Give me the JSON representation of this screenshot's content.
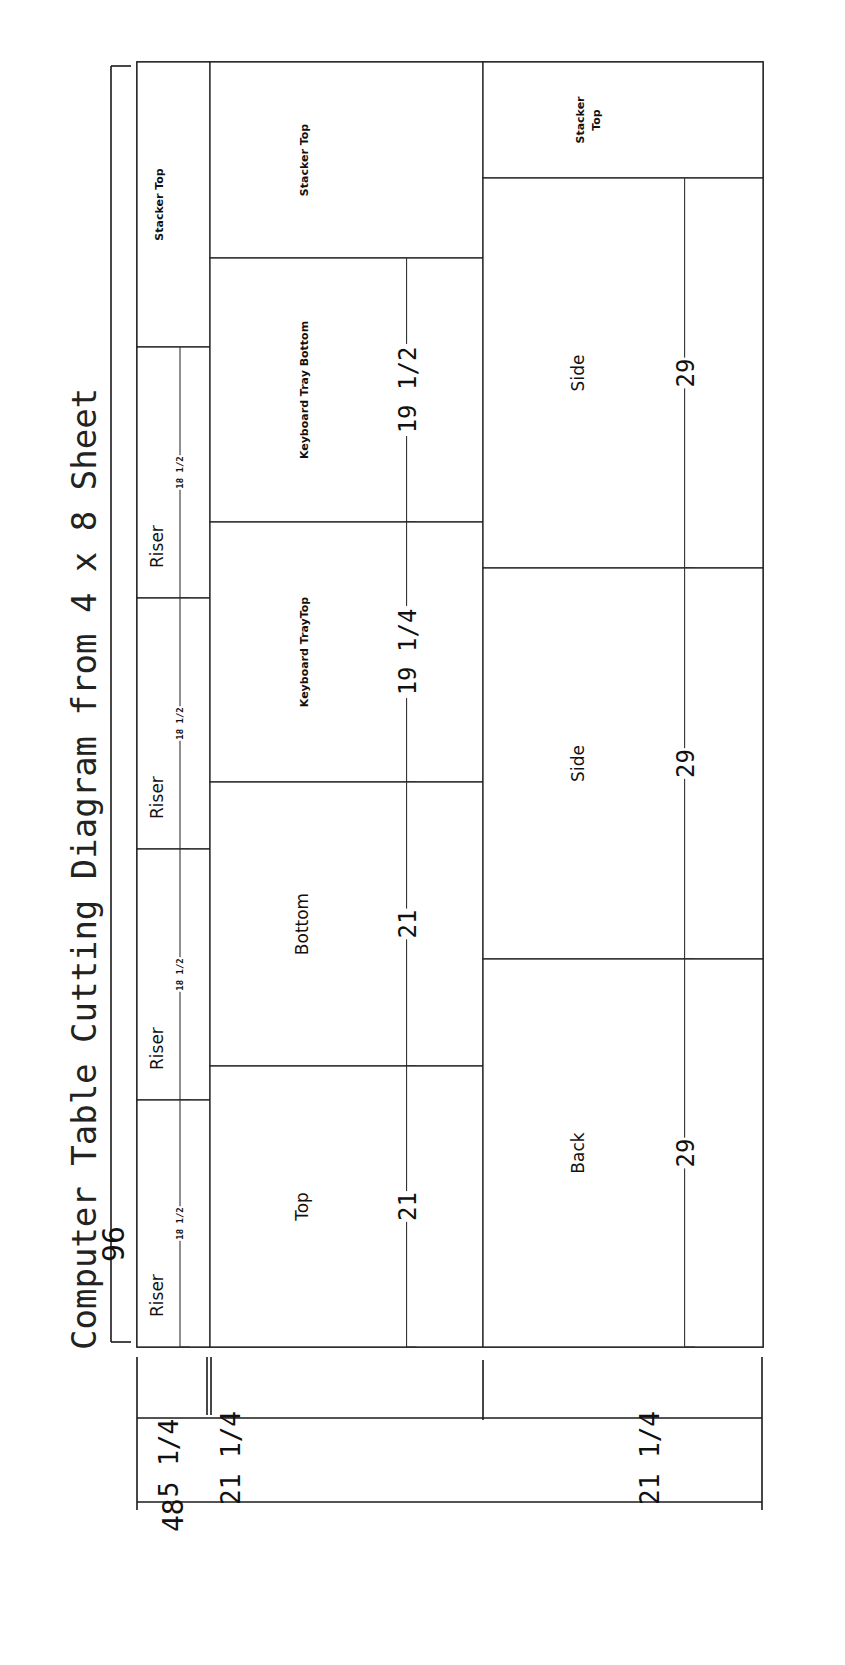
{
  "title": "Computer Table Cutting Diagram from 4 x 8 Sheet",
  "sheet": {
    "x": 137,
    "y": 62,
    "width": 626,
    "height": 1285,
    "length_label": "96",
    "width_label": "48"
  },
  "pieces": [
    {
      "label": "Stacker Top",
      "x": 137,
      "y": 62,
      "w": 73,
      "h": 285,
      "font": 11,
      "bold": true
    },
    {
      "label": "Riser",
      "x": 137,
      "y": 347,
      "w": 73,
      "h": 251,
      "font": 17,
      "dim": "18 1/2"
    },
    {
      "label": "Riser",
      "x": 137,
      "y": 598,
      "w": 73,
      "h": 251,
      "font": 17,
      "dim": "18 1/2"
    },
    {
      "label": "Riser",
      "x": 137,
      "y": 849,
      "w": 73,
      "h": 251,
      "font": 17,
      "dim": "18 1/2"
    },
    {
      "label": "Riser",
      "x": 137,
      "y": 1100,
      "w": 73,
      "h": 247,
      "font": 17,
      "dim": "18 1/2"
    },
    {
      "label": "Stacker Top",
      "x": 210,
      "y": 62,
      "w": 273,
      "h": 196,
      "font": 11,
      "bold": true
    },
    {
      "label": "Keyboard Tray Bottom",
      "x": 210,
      "y": 258,
      "w": 273,
      "h": 264,
      "font": 11,
      "bold": true,
      "dim": "19 1/2"
    },
    {
      "label": "Keyboard TrayTop",
      "x": 210,
      "y": 522,
      "w": 273,
      "h": 260,
      "font": 11,
      "bold": true,
      "dim": "19 1/4"
    },
    {
      "label": "Bottom",
      "x": 210,
      "y": 782,
      "w": 273,
      "h": 284,
      "font": 17,
      "dim": "21"
    },
    {
      "label": "Top",
      "x": 210,
      "y": 1066,
      "w": 273,
      "h": 281,
      "font": 17,
      "dim": "21"
    },
    {
      "label": "Stacker Top",
      "x": 483,
      "y": 62,
      "w": 280,
      "h": 116,
      "font": 11,
      "bold": true,
      "multiline": [
        "Stacker",
        "Top"
      ]
    },
    {
      "label": "Side",
      "x": 483,
      "y": 178,
      "w": 280,
      "h": 390,
      "font": 17,
      "dim": "29"
    },
    {
      "label": "Side",
      "x": 483,
      "y": 568,
      "w": 280,
      "h": 391,
      "font": 17,
      "dim": "29"
    },
    {
      "label": "Back",
      "x": 483,
      "y": 959,
      "w": 280,
      "h": 388,
      "font": 17,
      "dim": "29"
    }
  ],
  "width_dimensions": [
    {
      "label": "5 1/4",
      "from": 137,
      "to": 208
    },
    {
      "label": "21 1/4",
      "from": 212,
      "to": 483
    },
    {
      "label": "21 1/4",
      "from": 483,
      "to": 763
    }
  ],
  "colors": {
    "line": "#1a1a1a",
    "background": "#ffffff"
  }
}
